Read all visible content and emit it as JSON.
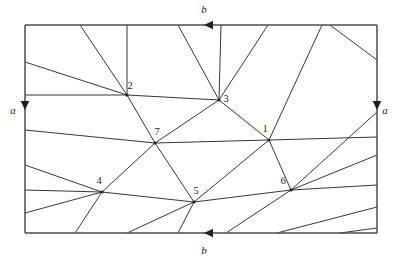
{
  "figure": {
    "canvas": {
      "width": 400,
      "height": 263,
      "background": "#ffffff"
    },
    "rect": {
      "left": 25,
      "top": 25,
      "right": 377,
      "bottom": 233
    },
    "colors": {
      "line": "#231f20",
      "boundary": "#4d4d4f",
      "background": "#ffffff"
    },
    "boundary_labels": [
      {
        "name": "top-edge-label",
        "text": "b",
        "x": 204,
        "y": 13
      },
      {
        "name": "left-edge-label",
        "text": "a",
        "x": 13,
        "y": 114
      },
      {
        "name": "right-edge-label",
        "text": "a",
        "x": 385,
        "y": 114
      },
      {
        "name": "bottom-edge-label",
        "text": "b",
        "x": 204,
        "y": 254
      }
    ],
    "arrows": [
      {
        "name": "top-edge-arrow",
        "x": 204,
        "y": 25,
        "direction": "left"
      },
      {
        "name": "bottom-edge-arrow",
        "x": 204,
        "y": 233,
        "direction": "left"
      },
      {
        "name": "left-edge-arrow",
        "x": 25,
        "y": 110,
        "direction": "down"
      },
      {
        "name": "right-edge-arrow",
        "x": 377,
        "y": 110,
        "direction": "down"
      }
    ],
    "nodes": [
      {
        "id": "1",
        "label": "1",
        "x": 269,
        "y": 140,
        "lx": 265,
        "ly": 132
      },
      {
        "id": "2",
        "label": "2",
        "x": 127,
        "y": 95,
        "lx": 130,
        "ly": 89
      },
      {
        "id": "3",
        "label": "3",
        "x": 219,
        "y": 100,
        "lx": 226,
        "ly": 102
      },
      {
        "id": "4",
        "label": "4",
        "x": 102,
        "y": 192,
        "lx": 99,
        "ly": 184
      },
      {
        "id": "5",
        "label": "5",
        "x": 194,
        "y": 202,
        "lx": 196,
        "ly": 194
      },
      {
        "id": "6",
        "label": "6",
        "x": 291,
        "y": 190,
        "lx": 283,
        "ly": 184
      }
    ],
    "interior_nodes": [
      {
        "id": "7",
        "label": "7",
        "x": 155,
        "y": 143,
        "lx": 157,
        "ly": 135
      }
    ],
    "segments": [
      {
        "name": "seg-2-3",
        "x1": 127,
        "y1": 95,
        "x2": 219,
        "y2": 100
      },
      {
        "name": "seg-2-7",
        "x1": 127,
        "y1": 95,
        "x2": 155,
        "y2": 143
      },
      {
        "name": "seg-3-7",
        "x1": 219,
        "y1": 100,
        "x2": 155,
        "y2": 143
      },
      {
        "name": "seg-3-1",
        "x1": 219,
        "y1": 100,
        "x2": 269,
        "y2": 140
      },
      {
        "name": "seg-7-1",
        "x1": 155,
        "y1": 143,
        "x2": 269,
        "y2": 140
      },
      {
        "name": "seg-7-5",
        "x1": 155,
        "y1": 143,
        "x2": 194,
        "y2": 202
      },
      {
        "name": "seg-7-4",
        "x1": 155,
        "y1": 143,
        "x2": 102,
        "y2": 192
      },
      {
        "name": "seg-4-5",
        "x1": 102,
        "y1": 192,
        "x2": 194,
        "y2": 202
      },
      {
        "name": "seg-5-6",
        "x1": 194,
        "y1": 202,
        "x2": 291,
        "y2": 190
      },
      {
        "name": "seg-5-1",
        "x1": 194,
        "y1": 202,
        "x2": 269,
        "y2": 140
      },
      {
        "name": "seg-1-6",
        "x1": 269,
        "y1": 140,
        "x2": 291,
        "y2": 190
      },
      {
        "name": "seg-2-top-vertical",
        "x1": 127,
        "y1": 95,
        "x2": 127,
        "y2": 25
      },
      {
        "name": "seg-2-top-diag",
        "x1": 127,
        "y1": 95,
        "x2": 80,
        "y2": 25
      },
      {
        "name": "seg-2-left-upper",
        "x1": 127,
        "y1": 95,
        "x2": 25,
        "y2": 62
      },
      {
        "name": "seg-2-left-mid",
        "x1": 127,
        "y1": 95,
        "x2": 25,
        "y2": 95
      },
      {
        "name": "seg-3-top-vertical",
        "x1": 219,
        "y1": 100,
        "x2": 221,
        "y2": 25
      },
      {
        "name": "seg-3-top-left",
        "x1": 219,
        "y1": 100,
        "x2": 178,
        "y2": 25
      },
      {
        "name": "seg-3-top-right",
        "x1": 219,
        "y1": 100,
        "x2": 268,
        "y2": 25
      },
      {
        "name": "seg-7-left",
        "x1": 155,
        "y1": 143,
        "x2": 25,
        "y2": 130
      },
      {
        "name": "seg-1-right",
        "x1": 269,
        "y1": 140,
        "x2": 377,
        "y2": 137
      },
      {
        "name": "seg-1-top-right",
        "x1": 269,
        "y1": 140,
        "x2": 322,
        "y2": 25
      },
      {
        "name": "seg-4-left-upper",
        "x1": 102,
        "y1": 192,
        "x2": 25,
        "y2": 165
      },
      {
        "name": "seg-4-left-mid",
        "x1": 102,
        "y1": 192,
        "x2": 25,
        "y2": 190
      },
      {
        "name": "seg-4-left-lower",
        "x1": 102,
        "y1": 192,
        "x2": 25,
        "y2": 213
      },
      {
        "name": "seg-4-bottom",
        "x1": 102,
        "y1": 192,
        "x2": 75,
        "y2": 233
      },
      {
        "name": "seg-5-bottom-left",
        "x1": 194,
        "y1": 202,
        "x2": 127,
        "y2": 233
      },
      {
        "name": "seg-5-bottom-mid",
        "x1": 194,
        "y1": 202,
        "x2": 178,
        "y2": 233
      },
      {
        "name": "seg-6-bottom-left",
        "x1": 291,
        "y1": 190,
        "x2": 226,
        "y2": 233
      },
      {
        "name": "seg-6-right-upper",
        "x1": 291,
        "y1": 190,
        "x2": 377,
        "y2": 112
      },
      {
        "name": "seg-6-right-mid",
        "x1": 291,
        "y1": 190,
        "x2": 377,
        "y2": 155
      },
      {
        "name": "seg-6-right-lower",
        "x1": 291,
        "y1": 190,
        "x2": 377,
        "y2": 185
      },
      {
        "name": "seg-bottom-right-a",
        "x1": 377,
        "y1": 207,
        "x2": 277,
        "y2": 233
      },
      {
        "name": "seg-bottom-right-b",
        "x1": 377,
        "y1": 228,
        "x2": 340,
        "y2": 233
      },
      {
        "name": "seg-right-top-diag",
        "x1": 377,
        "y1": 60,
        "x2": 330,
        "y2": 25
      }
    ]
  }
}
